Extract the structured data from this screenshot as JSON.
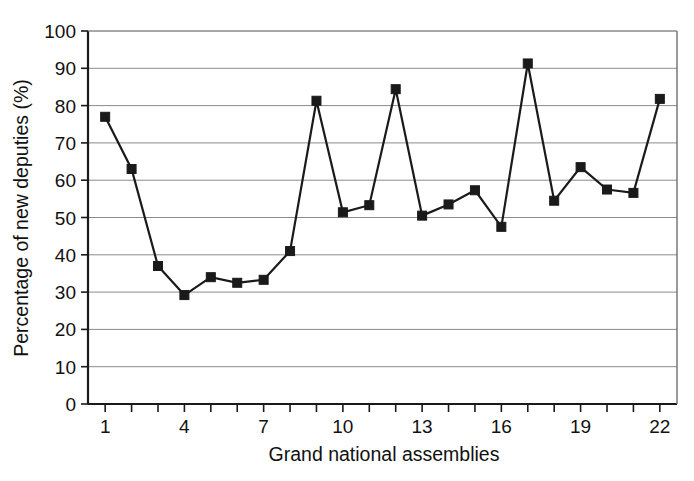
{
  "chart_data": {
    "type": "line",
    "title": "",
    "xlabel": "Grand national assemblies",
    "ylabel": "Percentage of new deputies (%)",
    "x": [
      1,
      2,
      3,
      4,
      5,
      6,
      7,
      8,
      9,
      10,
      11,
      12,
      13,
      14,
      15,
      16,
      17,
      18,
      19,
      20,
      21,
      22
    ],
    "values": [
      77,
      63,
      37,
      29.2,
      34,
      32.5,
      33.3,
      41,
      81.3,
      51.4,
      53.3,
      84.4,
      50.5,
      53.5,
      57.3,
      47.5,
      91.3,
      54.5,
      63.5,
      57.5,
      56.6,
      81.8
    ],
    "series": [
      {
        "name": "Percentage of new deputies",
        "values": [
          77,
          63,
          37,
          29.2,
          34,
          32.5,
          33.3,
          41,
          81.3,
          51.4,
          53.3,
          84.4,
          50.5,
          53.5,
          57.3,
          47.5,
          91.3,
          54.5,
          63.5,
          57.5,
          56.6,
          81.8
        ]
      }
    ],
    "xlim": [
      0.35,
      22.65
    ],
    "ylim": [
      0,
      100
    ],
    "ytick_values": [
      0,
      10,
      20,
      30,
      40,
      50,
      60,
      70,
      80,
      90,
      100
    ],
    "ytick_labels": [
      "0",
      "10",
      "20",
      "30",
      "40",
      "50",
      "60",
      "70",
      "80",
      "90",
      "100"
    ],
    "xtick_values": [
      1,
      2,
      3,
      4,
      5,
      6,
      7,
      8,
      9,
      10,
      11,
      12,
      13,
      14,
      15,
      16,
      17,
      18,
      19,
      20,
      21,
      22
    ],
    "xtick_labels_shown": [
      {
        "value": 1,
        "label": "1"
      },
      {
        "value": 4,
        "label": "4"
      },
      {
        "value": 7,
        "label": "7"
      },
      {
        "value": 10,
        "label": "10"
      },
      {
        "value": 13,
        "label": "13"
      },
      {
        "value": 16,
        "label": "16"
      },
      {
        "value": 19,
        "label": "19"
      },
      {
        "value": 22,
        "label": "22"
      }
    ],
    "grid": "horizontal",
    "legend": "none",
    "marker": "square",
    "line_color": "#1a1a1a",
    "marker_color": "#1a1a1a",
    "gridline_color": "#8a8a8a",
    "background_color": "#ffffff"
  }
}
